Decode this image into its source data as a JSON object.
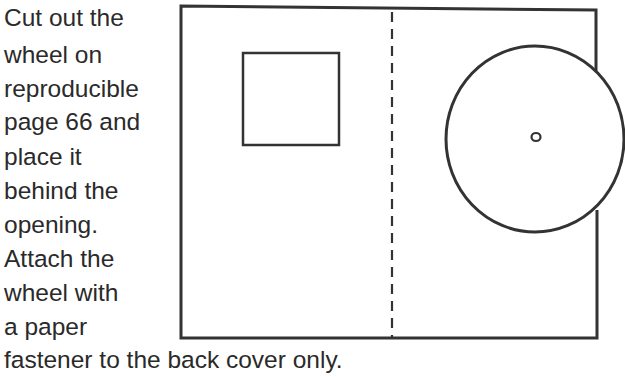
{
  "instructions": {
    "lines": [
      "Cut out the",
      "wheel on",
      "reproducible",
      "page 66 and",
      "place it",
      "behind the",
      "opening.",
      "Attach the",
      "wheel with",
      "a paper",
      "fastener to the back cover only."
    ]
  },
  "diagram": {
    "stroke_color": "#333333",
    "background": "#ffffff",
    "elements": [
      "outer-cover-rectangle",
      "square-opening",
      "dashed-fold-line",
      "wheel-circle",
      "fastener-hole"
    ]
  }
}
